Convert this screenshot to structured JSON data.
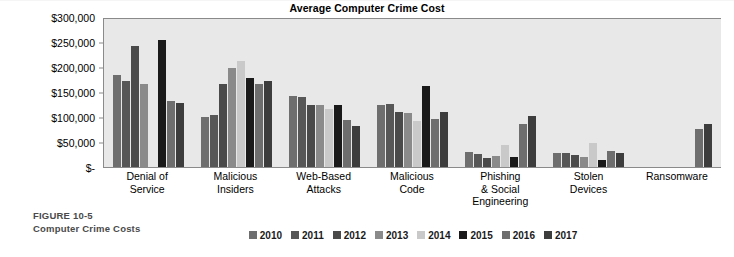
{
  "figure": {
    "number": "FIGURE 10-5",
    "name": "Computer Crime Costs"
  },
  "chart_data": {
    "type": "bar",
    "title": "Average Computer Crime Cost",
    "xlabel": "",
    "ylabel": "",
    "ylim": [
      0,
      300000
    ],
    "grid": false,
    "legend_position": "bottom",
    "y_ticks": [
      "$-",
      "$50,000",
      "$100,000",
      "$150,000",
      "$200,000",
      "$250,000",
      "$300,000"
    ],
    "y_tick_values": [
      0,
      50000,
      100000,
      150000,
      200000,
      250000,
      300000
    ],
    "categories": [
      "Denial of Service",
      "Malicious Insiders",
      "Web-Based Attacks",
      "Malicious Code",
      "Phishing & Social Engineering",
      "Stolen Devices",
      "Ransomware"
    ],
    "category_lines": [
      [
        "Denial of",
        "Service"
      ],
      [
        "Malicious",
        "Insiders"
      ],
      [
        "Web-Based",
        "Attacks"
      ],
      [
        "Malicious",
        "Code"
      ],
      [
        "Phishing",
        "& Social",
        "Engineering"
      ],
      [
        "Stolen",
        "Devices"
      ],
      [
        "Ransomware"
      ]
    ],
    "series": [
      {
        "name": "2010",
        "color": "#6e6e6e",
        "values": [
          185000,
          101000,
          143000,
          124000,
          30000,
          28000,
          null
        ]
      },
      {
        "name": "2011",
        "color": "#575757",
        "values": [
          172000,
          105000,
          141000,
          126000,
          27000,
          28000,
          null
        ]
      },
      {
        "name": "2012",
        "color": "#4a4a4a",
        "values": [
          243000,
          166000,
          125000,
          111000,
          19000,
          25000,
          null
        ]
      },
      {
        "name": "2013",
        "color": "#8a8a8a",
        "values": [
          166000,
          198000,
          124000,
          108000,
          22000,
          20000,
          null
        ]
      },
      {
        "name": "2014",
        "color": "#c9c9c9",
        "values": [
          null,
          212000,
          116000,
          93000,
          44000,
          48000,
          null
        ]
      },
      {
        "name": "2015",
        "color": "#1a1a1a",
        "values": [
          255000,
          179000,
          124000,
          163000,
          21000,
          14000,
          null
        ]
      },
      {
        "name": "2016",
        "color": "#6e6e6e",
        "values": [
          132000,
          166000,
          95000,
          97000,
          87000,
          32000,
          77000
        ]
      },
      {
        "name": "2017",
        "color": "#3d3d3d",
        "values": [
          128000,
          173000,
          83000,
          110000,
          102000,
          29000,
          86000
        ]
      }
    ]
  },
  "legend": {
    "items": [
      {
        "label": "2010",
        "color": "#6e6e6e"
      },
      {
        "label": "2011",
        "color": "#575757"
      },
      {
        "label": "2012",
        "color": "#4a4a4a"
      },
      {
        "label": "2013",
        "color": "#8a8a8a"
      },
      {
        "label": "2014",
        "color": "#c9c9c9"
      },
      {
        "label": "2015",
        "color": "#1a1a1a"
      },
      {
        "label": "2016",
        "color": "#6e6e6e"
      },
      {
        "label": "2017",
        "color": "#3d3d3d"
      }
    ]
  }
}
